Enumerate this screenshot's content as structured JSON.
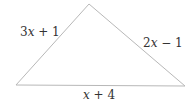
{
  "diagram": {
    "shape": "triangle",
    "vertices": {
      "apex": [
        89,
        4
      ],
      "left": [
        16,
        85
      ],
      "right": [
        185,
        86
      ]
    },
    "stroke_color": "#b8b8b8",
    "label_color": "#333333",
    "sides": {
      "left": {
        "var": "3x",
        "var_letter": "x",
        "coef": "3",
        "rest": " + 1",
        "text": "3x + 1"
      },
      "right": {
        "var": "2x",
        "var_letter": "x",
        "coef": "2",
        "rest": " − 1",
        "text": "2x − 1"
      },
      "base": {
        "var": "x",
        "var_letter": "x",
        "coef": "",
        "rest": " + 4",
        "text": "x + 4"
      }
    }
  }
}
